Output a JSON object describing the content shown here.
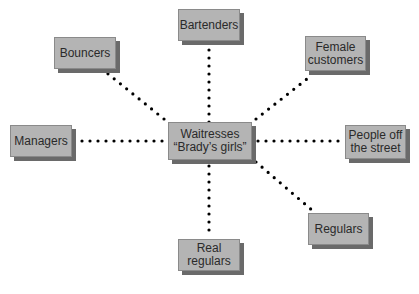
{
  "diagram": {
    "type": "hub-and-spoke",
    "center": {
      "id": "center",
      "label_line1": "Waitresses",
      "label_line2": "“Brady’s girls”"
    },
    "nodes": [
      {
        "id": "bartenders",
        "label_line1": "Bartenders",
        "label_line2": ""
      },
      {
        "id": "bouncers",
        "label_line1": "Bouncers",
        "label_line2": ""
      },
      {
        "id": "female-customers",
        "label_line1": "Female",
        "label_line2": "customers"
      },
      {
        "id": "managers",
        "label_line1": "Managers",
        "label_line2": ""
      },
      {
        "id": "people-off-street",
        "label_line1": "People off",
        "label_line2": "the street"
      },
      {
        "id": "regulars",
        "label_line1": "Regulars",
        "label_line2": ""
      },
      {
        "id": "real-regulars",
        "label_line1": "Real",
        "label_line2": "regulars"
      }
    ],
    "edges": [
      {
        "from": "center",
        "to": "bartenders",
        "style": "dotted"
      },
      {
        "from": "center",
        "to": "bouncers",
        "style": "dotted"
      },
      {
        "from": "center",
        "to": "female-customers",
        "style": "dotted"
      },
      {
        "from": "center",
        "to": "managers",
        "style": "dotted"
      },
      {
        "from": "center",
        "to": "people-off-street",
        "style": "dotted"
      },
      {
        "from": "center",
        "to": "regulars",
        "style": "dotted"
      },
      {
        "from": "center",
        "to": "real-regulars",
        "style": "dotted"
      }
    ],
    "colors": {
      "box_fill": "#b4b4b4",
      "box_shadow": "#6a6a6a",
      "dots": "#000000",
      "text": "#2a2a2a"
    }
  }
}
